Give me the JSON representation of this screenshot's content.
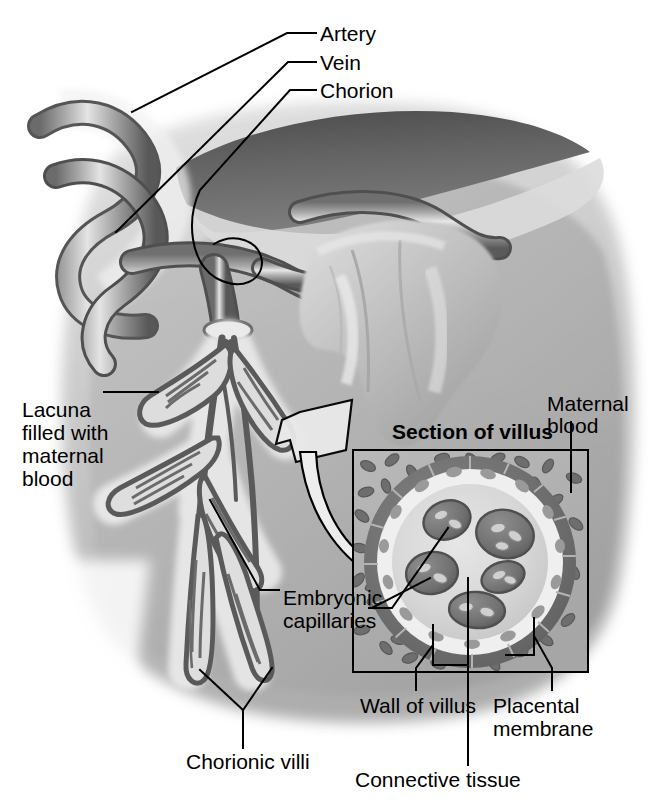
{
  "figure": {
    "style": "grayscale medical illustration"
  },
  "palette": {
    "ink": "#000000",
    "paper": "#ffffff",
    "chorion_dark": "#5d5d5d",
    "chorion_dark_2": "#6e6e6e",
    "vessel_outline": "#4a4a4a",
    "vessel_mid": "#8c8c8c",
    "vessel_light": "#d8d8d8",
    "tissue_light": "#d2d2d2",
    "tissue_mid": "#b9b9b9",
    "tissue_dark": "#a0a0a0",
    "lacuna_bg": "#b0b0b0",
    "villus_wall": "#737373",
    "villus_core": "#d9d9d9",
    "capillary": "#7a7a7a",
    "capillary_dark": "#606060",
    "rbc_maternal": "#6f6f6f",
    "arrow_fill": "#e8e8e8"
  },
  "labels": [
    {
      "id": "artery",
      "text": "Artery",
      "x": 320,
      "y": 22,
      "bold": false
    },
    {
      "id": "vein",
      "text": "Vein",
      "x": 320,
      "y": 51,
      "bold": false
    },
    {
      "id": "chorion",
      "text": "Chorion",
      "x": 320,
      "y": 79,
      "bold": false
    },
    {
      "id": "maternal-blood-1",
      "text": "Maternal",
      "x": 547,
      "y": 392,
      "bold": false
    },
    {
      "id": "maternal-blood-2",
      "text": "blood",
      "x": 547,
      "y": 414,
      "bold": false
    },
    {
      "id": "section-of-villus",
      "text": "Section of villus",
      "x": 392,
      "y": 420,
      "bold": true
    },
    {
      "id": "lacuna-1",
      "text": "Lacuna",
      "x": 22,
      "y": 398,
      "bold": false
    },
    {
      "id": "lacuna-2",
      "text": "filled with",
      "x": 22,
      "y": 421,
      "bold": false
    },
    {
      "id": "lacuna-3",
      "text": "maternal",
      "x": 22,
      "y": 444,
      "bold": false
    },
    {
      "id": "lacuna-4",
      "text": "blood",
      "x": 22,
      "y": 467,
      "bold": false
    },
    {
      "id": "embryonic-1",
      "text": "Embryonic",
      "x": 283,
      "y": 597,
      "bold": false
    },
    {
      "id": "embryonic-2",
      "text": "capillaries",
      "x": 283,
      "y": 620,
      "bold": false
    },
    {
      "id": "chorionic-villi",
      "text": "Chorionic villi",
      "x": 186,
      "y": 757,
      "bold": false
    },
    {
      "id": "wall-of-villus",
      "text": "Wall of villus",
      "x": 360,
      "y": 700,
      "bold": false
    },
    {
      "id": "placental-1",
      "text": "Placental",
      "x": 493,
      "y": 700,
      "bold": false
    },
    {
      "id": "placental-2",
      "text": "membrane",
      "x": 493,
      "y": 723,
      "bold": false
    },
    {
      "id": "connective-tissue",
      "text": "Connective tissue",
      "x": 355,
      "y": 775,
      "bold": false
    }
  ],
  "anatomy": {
    "section_box": {
      "x": 353,
      "y": 450,
      "width": 235,
      "height": 222
    },
    "villus_circle": {
      "cx": 470,
      "cy": 562,
      "r": 106,
      "wall_thickness": 13
    },
    "capillaries_count": 6,
    "structures": [
      "umbilical artery",
      "umbilical vein",
      "chorion",
      "chorionic villi",
      "intervillous lacuna",
      "embryonic capillaries",
      "villus wall",
      "connective tissue",
      "placental membrane",
      "maternal blood"
    ]
  }
}
